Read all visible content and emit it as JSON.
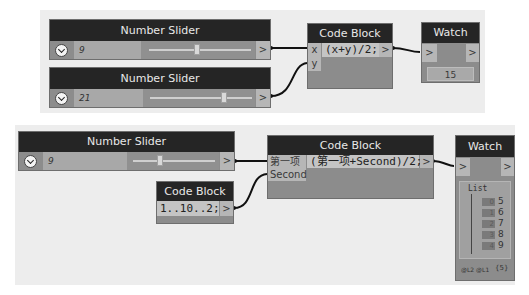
{
  "top_group": {
    "slider1": {
      "title": "Number Slider",
      "value": "9",
      "output": ">"
    },
    "slider2": {
      "title": "Number Slider",
      "value": "21",
      "output": ">"
    },
    "code_block": {
      "title": "Code Block",
      "inputs": [
        "x",
        "y"
      ],
      "code": "(x+y)/2;",
      "output": ">"
    },
    "watch": {
      "title": "Watch",
      "input": ">",
      "output": ">",
      "value": "15"
    }
  },
  "bottom_group": {
    "slider": {
      "title": "Number Slider",
      "value": "9",
      "output": ">"
    },
    "code_block_range": {
      "title": "Code Block",
      "code": "1..10..2;",
      "output": ">"
    },
    "code_block": {
      "title": "Code Block",
      "inputs": [
        "第一项",
        "Second"
      ],
      "code": "(第一项+Second)/2;",
      "output": ">"
    },
    "watch": {
      "title": "Watch",
      "input": ">",
      "output": ">",
      "list_label": "List",
      "items": [
        {
          "index": "0",
          "value": "5"
        },
        {
          "index": "1",
          "value": "6"
        },
        {
          "index": "2",
          "value": "7"
        },
        {
          "index": "3",
          "value": "8"
        },
        {
          "index": "4",
          "value": "9"
        }
      ],
      "levels": "@L2 @L1",
      "count": "{5}"
    }
  }
}
